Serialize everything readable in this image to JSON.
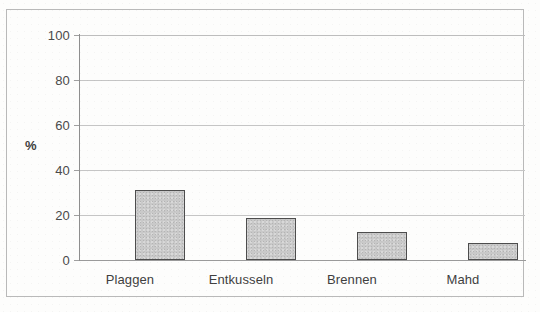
{
  "chart_data": {
    "type": "bar",
    "title": "",
    "xlabel": "",
    "ylabel": "%",
    "categories": [
      "Plaggen",
      "Entkusseln",
      "Brennen",
      "Mahd"
    ],
    "values": [
      31,
      18.5,
      12.5,
      7.5
    ],
    "ylim": [
      0,
      100
    ],
    "ytick_labels": [
      "0",
      "20",
      "40",
      "60",
      "80",
      "100"
    ],
    "ytick_values": [
      0,
      20,
      40,
      60,
      80,
      100
    ],
    "grid": "horizontal",
    "legend": "none",
    "colors": {
      "bar_fill": "#c9c9c9",
      "bar_border": "#4d4d4d",
      "gridline": "#c5c5c5",
      "axis": "#8e8e8e",
      "text": "#3f3f3f",
      "background": "#fdfdfc",
      "frame": "#b9b9b9"
    }
  }
}
